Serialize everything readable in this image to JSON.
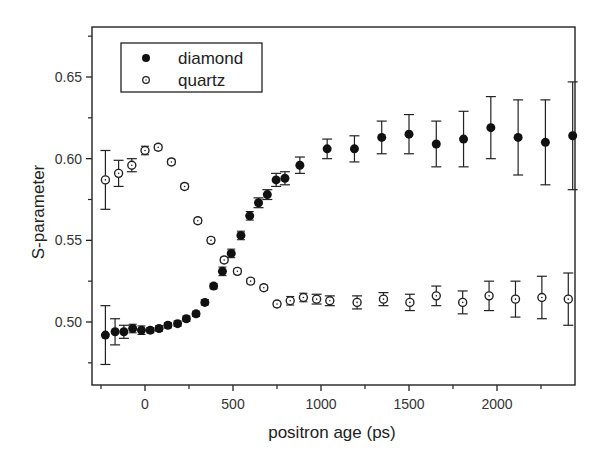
{
  "chart_data": {
    "type": "scatter",
    "title": "",
    "xlabel": "positron age (ps)",
    "ylabel": "S-parameter",
    "xlim": [
      -280,
      2470
    ],
    "ylim": [
      0.468,
      0.68
    ],
    "x_ticks": [
      0,
      500,
      1000,
      1500,
      2000
    ],
    "x_tick_labels": [
      "0",
      "500",
      "1000",
      "1500",
      "2000"
    ],
    "x_minor_ticks": [
      -250,
      250,
      750,
      1250,
      1750,
      2250
    ],
    "y_ticks": [
      0.5,
      0.55,
      0.6,
      0.65
    ],
    "y_tick_labels": [
      "0.50",
      "0.55",
      "0.60",
      "0.65"
    ],
    "y_minor_ticks": [
      0.475,
      0.525,
      0.575,
      0.625,
      0.675
    ],
    "grid": false,
    "legend_position": "upper-left",
    "series": [
      {
        "name": "diamond",
        "marker": "filled-circle",
        "color": "#111111",
        "points": [
          {
            "x": -225,
            "y": 0.492,
            "err": 0.018
          },
          {
            "x": -170,
            "y": 0.494,
            "err": 0.008
          },
          {
            "x": -120,
            "y": 0.494,
            "err": 0.004
          },
          {
            "x": -70,
            "y": 0.496,
            "err": 0.002
          },
          {
            "x": -20,
            "y": 0.495,
            "err": 0.002
          },
          {
            "x": 30,
            "y": 0.495,
            "err": 0.001
          },
          {
            "x": 80,
            "y": 0.496,
            "err": 0.001
          },
          {
            "x": 130,
            "y": 0.498,
            "err": 0.001
          },
          {
            "x": 185,
            "y": 0.499,
            "err": 0.001
          },
          {
            "x": 235,
            "y": 0.502,
            "err": 0.001
          },
          {
            "x": 290,
            "y": 0.505,
            "err": 0.001
          },
          {
            "x": 340,
            "y": 0.512,
            "err": 0.001
          },
          {
            "x": 390,
            "y": 0.522,
            "err": 0.001
          },
          {
            "x": 440,
            "y": 0.531,
            "err": 0.002
          },
          {
            "x": 490,
            "y": 0.542,
            "err": 0.002
          },
          {
            "x": 545,
            "y": 0.553,
            "err": 0.002
          },
          {
            "x": 595,
            "y": 0.565,
            "err": 0.002
          },
          {
            "x": 645,
            "y": 0.573,
            "err": 0.003
          },
          {
            "x": 695,
            "y": 0.578,
            "err": 0.003
          },
          {
            "x": 745,
            "y": 0.587,
            "err": 0.004
          },
          {
            "x": 795,
            "y": 0.588,
            "err": 0.004
          },
          {
            "x": 880,
            "y": 0.596,
            "err": 0.005
          },
          {
            "x": 1035,
            "y": 0.606,
            "err": 0.006
          },
          {
            "x": 1190,
            "y": 0.606,
            "err": 0.008
          },
          {
            "x": 1345,
            "y": 0.613,
            "err": 0.01
          },
          {
            "x": 1500,
            "y": 0.615,
            "err": 0.012
          },
          {
            "x": 1655,
            "y": 0.609,
            "err": 0.014
          },
          {
            "x": 1810,
            "y": 0.612,
            "err": 0.017
          },
          {
            "x": 1965,
            "y": 0.619,
            "err": 0.019
          },
          {
            "x": 2120,
            "y": 0.613,
            "err": 0.023
          },
          {
            "x": 2275,
            "y": 0.61,
            "err": 0.026
          },
          {
            "x": 2430,
            "y": 0.614,
            "err": 0.033
          }
        ]
      },
      {
        "name": "quartz",
        "marker": "open-circle",
        "color": "#111111",
        "points": [
          {
            "x": -225,
            "y": 0.587,
            "err": 0.018
          },
          {
            "x": -150,
            "y": 0.591,
            "err": 0.008
          },
          {
            "x": -75,
            "y": 0.596,
            "err": 0.004
          },
          {
            "x": 0,
            "y": 0.605,
            "err": 0.002
          },
          {
            "x": 75,
            "y": 0.607,
            "err": 0.001
          },
          {
            "x": 150,
            "y": 0.598,
            "err": 0.001
          },
          {
            "x": 225,
            "y": 0.583,
            "err": 0.001
          },
          {
            "x": 300,
            "y": 0.562,
            "err": 0.001
          },
          {
            "x": 375,
            "y": 0.55,
            "err": 0.001
          },
          {
            "x": 450,
            "y": 0.538,
            "err": 0.001
          },
          {
            "x": 525,
            "y": 0.531,
            "err": 0.001
          },
          {
            "x": 600,
            "y": 0.525,
            "err": 0.001
          },
          {
            "x": 675,
            "y": 0.521,
            "err": 0.001
          },
          {
            "x": 750,
            "y": 0.511,
            "err": 0.001
          },
          {
            "x": 825,
            "y": 0.513,
            "err": 0.002
          },
          {
            "x": 900,
            "y": 0.515,
            "err": 0.002
          },
          {
            "x": 975,
            "y": 0.514,
            "err": 0.003
          },
          {
            "x": 1050,
            "y": 0.513,
            "err": 0.003
          },
          {
            "x": 1205,
            "y": 0.512,
            "err": 0.004
          },
          {
            "x": 1355,
            "y": 0.514,
            "err": 0.004
          },
          {
            "x": 1505,
            "y": 0.512,
            "err": 0.005
          },
          {
            "x": 1655,
            "y": 0.516,
            "err": 0.006
          },
          {
            "x": 1805,
            "y": 0.512,
            "err": 0.007
          },
          {
            "x": 1955,
            "y": 0.516,
            "err": 0.009
          },
          {
            "x": 2105,
            "y": 0.514,
            "err": 0.011
          },
          {
            "x": 2255,
            "y": 0.515,
            "err": 0.013
          },
          {
            "x": 2405,
            "y": 0.514,
            "err": 0.016
          }
        ]
      }
    ]
  },
  "legend": {
    "items": [
      {
        "label": "diamond",
        "marker": "filled-circle"
      },
      {
        "label": "quartz",
        "marker": "open-circle"
      }
    ]
  },
  "axes": {
    "xlabel": "positron age (ps)",
    "ylabel": "S-parameter"
  }
}
